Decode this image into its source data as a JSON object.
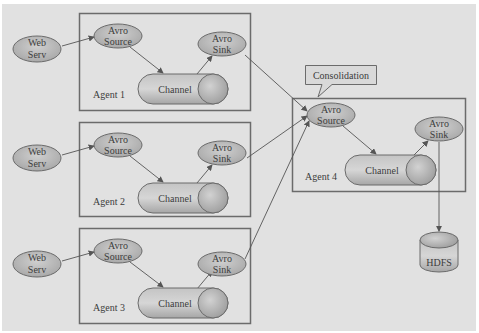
{
  "diagram": {
    "type": "flume-multi-agent-consolidation",
    "colors": {
      "background": "#e1e1e1",
      "node_fill": "#b9b9b9",
      "border": "#6b6b6b",
      "text": "#3c3c3c"
    },
    "callout": {
      "label": "Consolidation"
    },
    "agents": [
      {
        "label": "Agent 1",
        "web_label": [
          "Web",
          "Serv"
        ],
        "source_label": [
          "Avro",
          "Source"
        ],
        "channel_label": "Channel",
        "sink_label": [
          "Avro",
          "Sink"
        ]
      },
      {
        "label": "Agent 2",
        "web_label": [
          "Web",
          "Serv"
        ],
        "source_label": [
          "Avro",
          "Source"
        ],
        "channel_label": "Channel",
        "sink_label": [
          "Avro",
          "Sink"
        ]
      },
      {
        "label": "Agent 3",
        "web_label": [
          "Web",
          "Serv"
        ],
        "source_label": [
          "Avro",
          "Source"
        ],
        "channel_label": "Channel",
        "sink_label": [
          "Avro",
          "Sink"
        ]
      },
      {
        "label": "Agent 4",
        "source_label": [
          "Avro",
          "Source"
        ],
        "channel_label": "Channel",
        "sink_label": [
          "Avro",
          "Sink"
        ]
      }
    ],
    "storage": {
      "label": "HDFS"
    },
    "edges": [
      "Web Serv -> Agent 1 Avro Source",
      "Agent 1 Avro Source -> Channel -> Avro Sink",
      "Web Serv -> Agent 2 Avro Source",
      "Agent 2 Avro Source -> Channel -> Avro Sink",
      "Web Serv -> Agent 3 Avro Source",
      "Agent 3 Avro Source -> Channel -> Avro Sink",
      "Agent 1/2/3 Avro Sink -> Agent 4 Avro Source",
      "Agent 4 Avro Source -> Channel -> Avro Sink",
      "Agent 4 Avro Sink -> HDFS"
    ]
  }
}
